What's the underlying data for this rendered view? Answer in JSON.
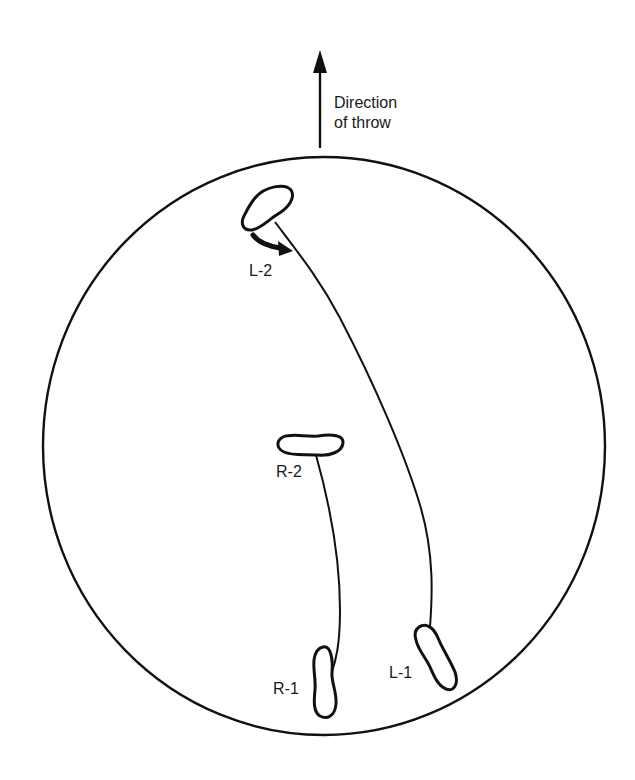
{
  "diagram": {
    "type": "footwork-diagram",
    "colors": {
      "ink": "#111111",
      "background": "#ffffff"
    },
    "direction": {
      "line1": "Direction",
      "line2": "of throw"
    },
    "footprints": [
      {
        "id": "L-2",
        "label": "L-2",
        "foot": "left",
        "step": 2
      },
      {
        "id": "R-2",
        "label": "R-2",
        "foot": "right",
        "step": 2
      },
      {
        "id": "R-1",
        "label": "R-1",
        "foot": "right",
        "step": 1
      },
      {
        "id": "L-1",
        "label": "L-1",
        "foot": "left",
        "step": 1
      }
    ],
    "annotations": {
      "pivot_arrow": "pivot-arrow at L-2"
    }
  }
}
